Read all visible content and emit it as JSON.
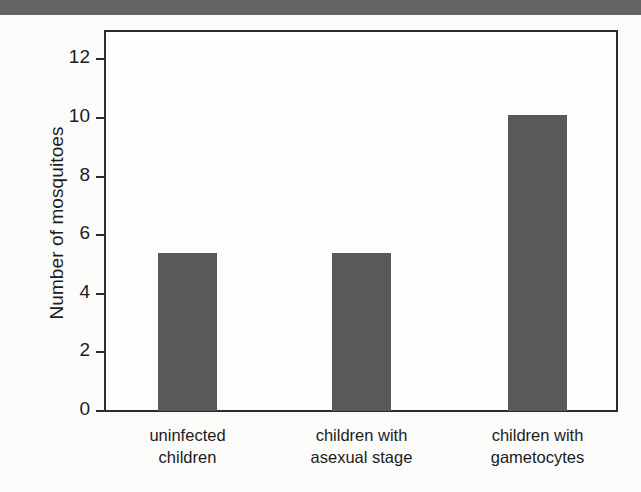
{
  "figure": {
    "top_band_color": "#636363",
    "background_color": "#fbfbfa",
    "axis_color": "#2b2b2b",
    "bar_color": "#595959"
  },
  "chart_data": {
    "type": "bar",
    "title": "",
    "xlabel": "",
    "ylabel": "Number of mosquitoes",
    "categories": [
      "uninfected children",
      "children with asexual stage",
      "children with gametocytes"
    ],
    "category_lines": [
      [
        "uninfected",
        "children"
      ],
      [
        "children with",
        "asexual stage"
      ],
      [
        "children with",
        "gametocytes"
      ]
    ],
    "values": [
      5.4,
      5.4,
      10.1
    ],
    "ylim": [
      0,
      13
    ],
    "yticks": [
      0,
      2,
      4,
      6,
      8,
      10,
      12
    ],
    "ytick_labels": [
      "0",
      "2",
      "4",
      "6",
      "8",
      "10",
      "12"
    ],
    "grid": false,
    "legend": false
  }
}
